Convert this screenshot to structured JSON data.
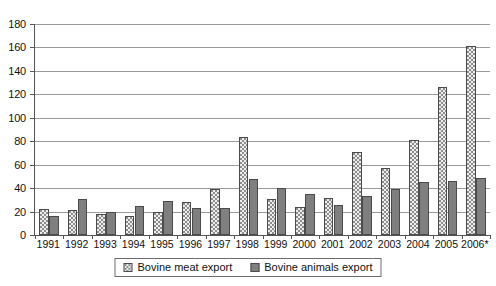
{
  "chart_data": {
    "type": "bar",
    "title": "",
    "subtitle": "",
    "xlabel": "",
    "ylabel": "",
    "ylim": [
      0,
      180
    ],
    "ytick_step": 20,
    "yticks": [
      0,
      20,
      40,
      60,
      80,
      100,
      120,
      140,
      160,
      180
    ],
    "grid": true,
    "grid_axis": "y",
    "legend_position": "bottom-center",
    "categories": [
      "1991",
      "1992",
      "1993",
      "1994",
      "1995",
      "1996",
      "1997",
      "1998",
      "1999",
      "2000",
      "2001",
      "2002",
      "2003",
      "2004",
      "2005",
      "2006*"
    ],
    "series": [
      {
        "name": "Bovine  meat export",
        "pattern": "dotted-light",
        "color": "#eeeeee",
        "values": [
          22,
          21,
          18,
          16,
          20,
          28,
          39,
          84,
          31,
          24,
          32,
          71,
          57,
          81,
          126,
          161
        ]
      },
      {
        "name": "Bovine animals export",
        "pattern": "solid-dark",
        "color": "#7f7f7f",
        "values": [
          16,
          31,
          20,
          25,
          29,
          23,
          23,
          48,
          40,
          35,
          26,
          33,
          39,
          45,
          46,
          49
        ]
      }
    ],
    "annotations": [
      "* 2006 value marked with asterisk"
    ]
  },
  "legend": {
    "entries": [
      {
        "label": "Bovine  meat export"
      },
      {
        "label": "Bovine animals export"
      }
    ]
  },
  "colors": {
    "meat_fill": "#eeeeee",
    "animals_fill": "#7f7f7f",
    "bar_border": "#4a4a4a",
    "gridline": "#9a9a9a",
    "axis": "#555555",
    "text": "#111111",
    "background": "#ffffff"
  }
}
